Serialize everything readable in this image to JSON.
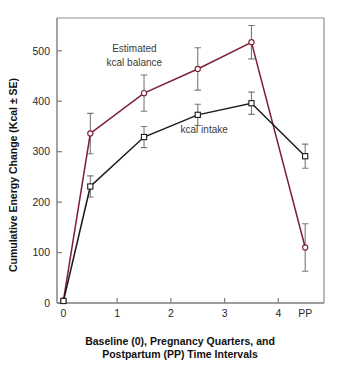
{
  "chart_data": {
    "type": "line",
    "title": "",
    "xlabel": "Baseline (0), Pregnancy Quarters, and Postpartum (PP) Time Intervals",
    "ylabel": "Cumulative Energy Change (Kcal ± SE)",
    "x": [
      0,
      0.5,
      1.5,
      2.5,
      3.5,
      4.5
    ],
    "xtick_positions": [
      0,
      1,
      2,
      3,
      4,
      4.5
    ],
    "xtick_labels": [
      "0",
      "1",
      "2",
      "3",
      "4",
      "PP"
    ],
    "ytick_labels": [
      "0",
      "100",
      "200",
      "300",
      "400",
      "500"
    ],
    "ytick_values": [
      0,
      100,
      200,
      300,
      400,
      500
    ],
    "xlim": [
      -0.12,
      4.85
    ],
    "ylim": [
      0,
      565
    ],
    "grid": false,
    "legend": "inline-annotations",
    "series": [
      {
        "name": "Estimated kcal balance",
        "color": "#7d2036",
        "marker": "open-circle",
        "values": [
          5,
          336,
          416,
          464,
          517,
          110
        ],
        "errors": [
          4,
          40,
          36,
          42,
          33,
          47
        ]
      },
      {
        "name": "kcal intake",
        "color": "#1b1b1b",
        "marker": "open-square",
        "values": [
          4,
          231,
          329,
          373,
          396,
          291
        ],
        "errors": [
          3,
          21,
          21,
          21,
          22,
          24
        ]
      }
    ],
    "annotations": [
      {
        "text": "Estimated",
        "x": 1.32,
        "y": 497
      },
      {
        "text": "kcal balance",
        "x": 1.32,
        "y": 470
      },
      {
        "text": "kcal intake",
        "x": 2.62,
        "y": 338
      }
    ]
  },
  "colors": {
    "balance_line": "#7d2036",
    "intake_line": "#1b1b1b",
    "axis": "#7d7d7d",
    "error_bar": "#7a7a7a",
    "background": "#ffffff"
  }
}
